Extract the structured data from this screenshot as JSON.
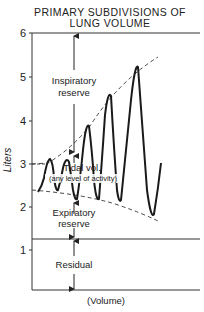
{
  "title": {
    "line1": "PRIMARY  SUBDIVISIONS  OF",
    "line2": "LUNG  VOLUME"
  },
  "axes": {
    "y_label": "Liters",
    "x_label": "(Volume)",
    "y_ticks": [
      "6",
      "5",
      "4",
      "3",
      "2",
      "1"
    ]
  },
  "regions": {
    "inspiratory_line1": "Inspiratory",
    "inspiratory_line2": "reserve",
    "tidal_line1": "Tidal vol.",
    "tidal_line2": "(any level of activity)",
    "expiratory_line1": "Expiratory",
    "expiratory_line2": "reserve",
    "residual": "Residual"
  },
  "values": {
    "total_capacity_l": 6,
    "residual_level_l": 1.2,
    "resting_end_expiratory_l": 2.4,
    "resting_end_inspiratory_l": 3.0
  },
  "colors": {
    "ink": "#222222",
    "background": "#ffffff"
  }
}
